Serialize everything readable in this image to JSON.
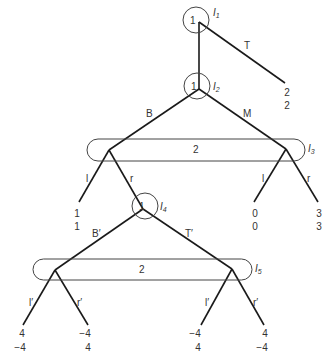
{
  "diagram": {
    "type": "extensive-form game tree",
    "info_sets": [
      {
        "id": "I1",
        "label": "I",
        "sub": "1",
        "player": "1"
      },
      {
        "id": "I2",
        "label": "I",
        "sub": "2",
        "player": "1"
      },
      {
        "id": "I3",
        "label": "I",
        "sub": "3",
        "player": "2"
      },
      {
        "id": "I4",
        "label": "I",
        "sub": "4",
        "player": "1"
      },
      {
        "id": "I5",
        "label": "I",
        "sub": "5",
        "player": "2"
      }
    ],
    "actions": {
      "I1_T": "T",
      "I2_B": "B",
      "I2_M": "M",
      "I3_left_l": "l",
      "I3_left_r": "r",
      "I3_right_l": "l",
      "I3_right_r": "r",
      "I4_B": "B′",
      "I4_T": "T′",
      "I5_left_l": "l′",
      "I5_left_r": "r′",
      "I5_right_l": "l′",
      "I5_right_r": "r′"
    },
    "payoffs": [
      {
        "id": "T",
        "p1": "2",
        "p2": "2"
      },
      {
        "id": "B-l",
        "p1": "1",
        "p2": "1"
      },
      {
        "id": "M-l",
        "p1": "0",
        "p2": "0"
      },
      {
        "id": "M-r",
        "p1": "3",
        "p2": "3"
      },
      {
        "id": "B-r-B'-l'",
        "p1": "4",
        "p2": "−4"
      },
      {
        "id": "B-r-B'-r'",
        "p1": "−4",
        "p2": "4"
      },
      {
        "id": "B-r-T'-l'",
        "p1": "−4",
        "p2": "4"
      },
      {
        "id": "B-r-T'-r'",
        "p1": "4",
        "p2": "−4"
      }
    ]
  }
}
